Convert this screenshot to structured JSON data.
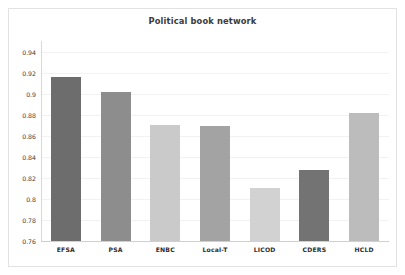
{
  "chart_data": {
    "type": "bar",
    "title": "Political book network",
    "xlabel": "",
    "ylabel": "",
    "categories": [
      "EFSA",
      "PSA",
      "ENBC",
      "Local-T",
      "LICOD",
      "CDERS",
      "HCLD"
    ],
    "values": [
      0.916,
      0.902,
      0.87,
      0.869,
      0.81,
      0.827,
      0.882
    ],
    "ylim": [
      0.76,
      0.95
    ],
    "ytick_labels": [
      "0.94",
      "0.92",
      "0.9",
      "0.88",
      "0.86",
      "0.84",
      "0.82",
      "0.8",
      "0.78",
      "0.76"
    ],
    "ytick_values": [
      0.94,
      0.92,
      0.9,
      0.88,
      0.86,
      0.84,
      0.82,
      0.8,
      0.78,
      0.76
    ],
    "grid": true,
    "legend": "none",
    "bar_colors": [
      "#6d6d6d",
      "#8d8d8d",
      "#cacaca",
      "#a3a3a3",
      "#d2d2d2",
      "#737373",
      "#bcbcbc"
    ],
    "bars": [
      {
        "label": "EFSA",
        "value": 0.916,
        "color": "#6d6d6d"
      },
      {
        "label": "PSA",
        "value": 0.902,
        "color": "#8d8d8d"
      },
      {
        "label": "ENBC",
        "value": 0.87,
        "color": "#cacaca"
      },
      {
        "label": "Local-T",
        "value": 0.869,
        "color": "#a3a3a3"
      },
      {
        "label": "LICOD",
        "value": 0.81,
        "color": "#d2d2d2"
      },
      {
        "label": "CDERS",
        "value": 0.827,
        "color": "#737373"
      },
      {
        "label": "HCLD",
        "value": 0.882,
        "color": "#bcbcbc"
      }
    ]
  },
  "figure": {
    "background": "#ffffff",
    "frame_color": "#e2e2e2",
    "grid_color": "#f2f2f2",
    "axis_color": "#d8d8d8",
    "title_color": "#3a3a3a",
    "tick_text_color": "#3c3c3c"
  }
}
